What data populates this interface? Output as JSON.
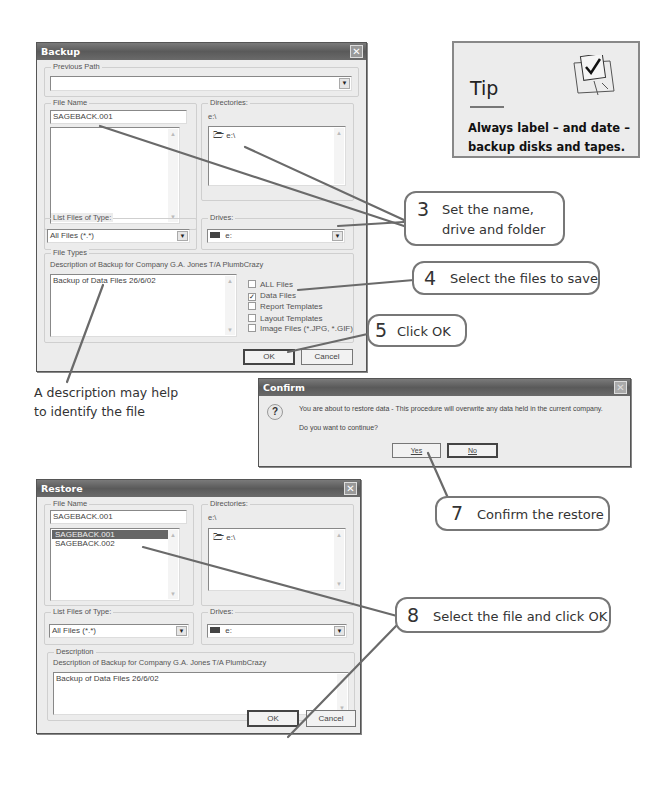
{
  "backup_dialog": {
    "title": "Backup",
    "previous_path": {
      "label": "Previous Path",
      "value": ""
    },
    "file_name": {
      "label": "File Name",
      "value": "SAGEBACK.001",
      "list_items": []
    },
    "directories": {
      "label": "Directories:",
      "current": "e:\\",
      "items": [
        "e:\\"
      ]
    },
    "list_files_of_type": {
      "label": "List Files of Type:",
      "value": "All Files (*.*)"
    },
    "drives": {
      "label": "Drives:",
      "value": "e:"
    },
    "file_types": {
      "label": "File Types",
      "description_label": "Description of Backup for Company G.A. Jones T/A PlumbCrazy",
      "description_value": "Backup of Data Files 26/6/02",
      "checkboxes": [
        {
          "label": "ALL Files",
          "checked": false
        },
        {
          "label": "Data Files",
          "checked": true
        },
        {
          "label": "Report Templates",
          "checked": false
        },
        {
          "label": "Layout Templates",
          "checked": false
        },
        {
          "label": "Image Files (*.JPG, *.GIF)",
          "checked": false
        }
      ]
    },
    "ok_label": "OK",
    "cancel_label": "Cancel"
  },
  "confirm_dialog": {
    "title": "Confirm",
    "message": "You are about to restore data - This procedure will overwrite any data held in the current company.",
    "question": "Do you want to continue?",
    "yes_label": "Yes",
    "no_label": "No",
    "icon": "question-icon"
  },
  "restore_dialog": {
    "title": "Restore",
    "file_name": {
      "label": "File Name",
      "value": "SAGEBACK.001",
      "list_items": [
        "SAGEBACK.001",
        "SAGEBACK.002"
      ],
      "selected_index": 0
    },
    "directories": {
      "label": "Directories:",
      "current": "e:\\",
      "items": [
        "e:\\"
      ]
    },
    "list_files_of_type": {
      "label": "List Files of Type:",
      "value": "All Files (*.*)"
    },
    "drives": {
      "label": "Drives:",
      "value": "e:"
    },
    "description": {
      "label": "Description",
      "description_label": "Description of Backup for Company G.A. Jones T/A PlumbCrazy",
      "description_value": "Backup of Data Files 26/6/02"
    },
    "ok_label": "OK",
    "cancel_label": "Cancel"
  },
  "tip": {
    "heading": "Tip",
    "text_line1": "Always label – and date –",
    "text_line2": "backup disks and tapes."
  },
  "callouts": [
    {
      "num": "3",
      "line1": "Set the name,",
      "line2": "drive and folder"
    },
    {
      "num": "4",
      "line1": "Select the files to save"
    },
    {
      "num": "5",
      "line1": "Click OK"
    },
    {
      "num": "7",
      "line1": "Confirm the restore"
    },
    {
      "num": "8",
      "line1": "Select the file and click OK"
    }
  ],
  "caption": {
    "line1": "A description may help",
    "line2": "to identify the file"
  }
}
